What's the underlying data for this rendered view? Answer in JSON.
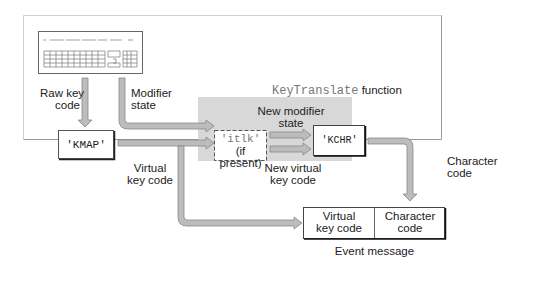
{
  "diagram": {
    "title_code": "KeyTranslate",
    "title_suffix": "function",
    "nodes": {
      "keyboard": "keyboard",
      "kmap": "'KMAP'",
      "itlk": "'itlk'",
      "itlk_note": "(if present)",
      "kchr": "'KCHR'"
    },
    "labels": {
      "raw_key_code_1": "Raw key",
      "raw_key_code_2": "code",
      "modifier_state_1": "Modifier",
      "modifier_state_2": "state",
      "virtual_key_code_1": "Virtual",
      "virtual_key_code_2": "key code",
      "new_modifier_1": "New modifier",
      "new_modifier_2": "state",
      "new_virtual_1": "New virtual",
      "new_virtual_2": "key code",
      "character_code_1": "Character",
      "character_code_2": "code"
    },
    "event_message": {
      "cell1_line1": "Virtual",
      "cell1_line2": "key code",
      "cell2_line1": "Character",
      "cell2_line2": "code",
      "caption": "Event message"
    },
    "colors": {
      "arrow_fill": "#b8b8b8",
      "arrow_stroke": "#8a8a8a",
      "function_box": "#d9d9d9",
      "frame": "#a8a8a8"
    }
  }
}
